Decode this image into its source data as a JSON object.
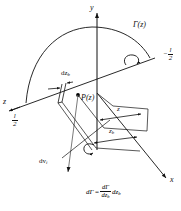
{
  "figure": {
    "type": "lifting-line-vortex-diagram",
    "axes": {
      "x_label": "x",
      "y_label": "y",
      "z_label": "z"
    },
    "labels": {
      "circulation_curve": "Γ(z)",
      "point_on_line": "P(z)",
      "element_width": "dz",
      "element_width_sub": "b",
      "induced_velocity": "dv",
      "induced_velocity_sub": "i",
      "dim_z": "z",
      "dim_zb": "z",
      "dim_zb_sub": "b",
      "span_right_sign": "−",
      "span_right_num": "l",
      "span_right_den": "2",
      "span_left_num": "l",
      "span_left_den": "2"
    },
    "formula": {
      "lhs": "dΓ",
      "equals": "=",
      "num": "dΓ",
      "den": "dz",
      "den_sub": "b",
      "trailing": "dz",
      "trailing_sub": "b"
    },
    "colors": {
      "stroke": "#111111",
      "background": "#ffffff",
      "point_fill": "#000000"
    }
  }
}
